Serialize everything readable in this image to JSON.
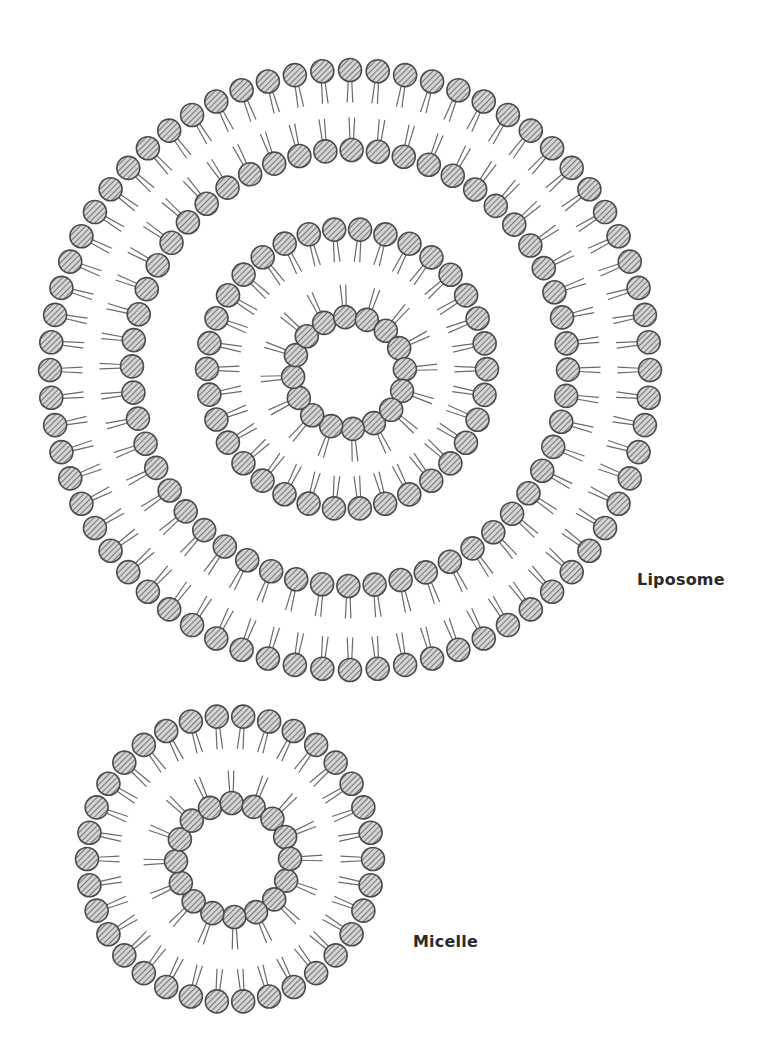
{
  "diagram": {
    "type": "lipid-assembly-illustration",
    "colors": {
      "background": "#ffffff",
      "head_fill": "#bdbdbd",
      "head_stroke": "#4a4a4a",
      "hatch": "#6a6a6a",
      "tail": "#6a6a6a"
    },
    "labels": {
      "liposome": "Liposome",
      "micelle": "Micelle"
    },
    "structures": [
      {
        "name": "liposome",
        "label": "Liposome",
        "rings": [
          {
            "role": "outer-leaflet",
            "cx": 350,
            "cy": 370,
            "r": 300,
            "count": 68,
            "orientation": "heads-out"
          },
          {
            "role": "inner-leaflet",
            "cx": 350,
            "cy": 368,
            "r": 218,
            "count": 52,
            "orientation": "heads-in"
          },
          {
            "role": "inner-vesicle-outer",
            "cx": 347,
            "cy": 369,
            "r": 140,
            "count": 34,
            "orientation": "heads-out"
          },
          {
            "role": "inner-vesicle-core",
            "cx": 349,
            "cy": 373,
            "r": 56,
            "count": 16,
            "orientation": "heads-in"
          }
        ]
      },
      {
        "name": "micelle",
        "label": "Micelle",
        "rings": [
          {
            "role": "outer-shell",
            "cx": 230,
            "cy": 859,
            "r": 143,
            "count": 34,
            "orientation": "heads-out"
          },
          {
            "role": "core",
            "cx": 233,
            "cy": 860,
            "r": 57,
            "count": 16,
            "orientation": "heads-in"
          }
        ]
      }
    ],
    "head_radius": 11.5,
    "tail_length": 22
  }
}
